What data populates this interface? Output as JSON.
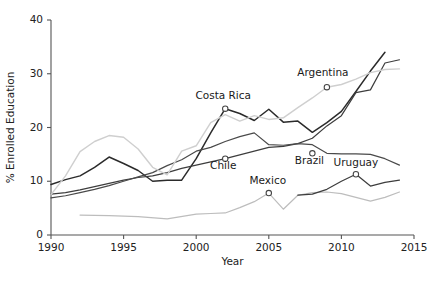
{
  "chart_data": {
    "type": "line",
    "title": "",
    "xlabel": "Year",
    "ylabel": "% Enrolled Education",
    "xlim": [
      1990,
      2015
    ],
    "ylim": [
      0,
      40
    ],
    "xticks": [
      1990,
      1995,
      2000,
      2005,
      2010,
      2015
    ],
    "yticks": [
      0,
      10,
      20,
      30,
      40
    ],
    "grid": false,
    "legend": "inline-annotations",
    "series": [
      {
        "name": "Costa Rica",
        "color": "#2b2b2b",
        "width": 1.5,
        "x": [
          1990,
          1991,
          1992,
          1993,
          1994,
          1995,
          1996,
          1997,
          1998,
          1999,
          2000,
          2001,
          2002,
          2003,
          2004,
          2005,
          2006,
          2007,
          2008,
          2009,
          2010,
          2011,
          2012,
          2013
        ],
        "y": [
          9.4,
          10.3,
          11.0,
          12.6,
          14.5,
          13.3,
          12.0,
          10.0,
          10.2,
          10.2,
          14.2,
          19.0,
          23.5,
          22.6,
          21.3,
          23.4,
          21.0,
          21.2,
          19.1,
          20.9,
          23.0,
          26.7,
          30.5,
          34.0
        ]
      },
      {
        "name": "Chile",
        "color": "#3d3d3d",
        "width": 1.2,
        "x": [
          1990,
          1991,
          1992,
          1993,
          1994,
          1995,
          1996,
          1997,
          1998,
          1999,
          2000,
          2001,
          2002,
          2003,
          2004,
          2005,
          2006,
          2007,
          2008,
          2009,
          2010,
          2011,
          2012,
          2013,
          2014
        ],
        "y": [
          7.6,
          7.9,
          8.4,
          9.0,
          9.6,
          10.2,
          10.7,
          11.0,
          11.6,
          12.4,
          13.0,
          13.6,
          14.2,
          14.9,
          15.6,
          16.3,
          16.5,
          17.0,
          18.0,
          20.3,
          22.2,
          26.5,
          27.0,
          32.0,
          32.6
        ]
      },
      {
        "name": "Brazil",
        "color": "#4a4a4a",
        "width": 1.2,
        "x": [
          1990,
          1991,
          1992,
          1993,
          1994,
          1995,
          1996,
          1997,
          1998,
          1999,
          2000,
          2001,
          2002,
          2003,
          2004,
          2005,
          2006,
          2007,
          2008,
          2009,
          2010,
          2011,
          2012,
          2013,
          2014
        ],
        "y": [
          6.9,
          7.3,
          7.9,
          8.5,
          9.2,
          10.0,
          10.8,
          11.6,
          12.9,
          14.0,
          15.6,
          16.3,
          17.4,
          18.3,
          19.0,
          16.8,
          16.7,
          17.0,
          16.8,
          15.2,
          15.1,
          15.1,
          15.0,
          14.2,
          13.0
        ]
      },
      {
        "name": "Argentina",
        "color": "#cfcfcf",
        "width": 1.4,
        "x": [
          1990,
          1991,
          1992,
          1993,
          1994,
          1995,
          1996,
          1997,
          1998,
          1999,
          2000,
          2001,
          2002,
          2003,
          2004,
          2005,
          2006,
          2007,
          2008,
          2009,
          2010,
          2011,
          2012,
          2013,
          2014
        ],
        "y": [
          7.5,
          11.0,
          15.5,
          17.4,
          18.5,
          18.2,
          16.0,
          12.6,
          11.2,
          15.6,
          16.6,
          20.9,
          22.4,
          21.2,
          22.2,
          21.5,
          21.8,
          23.7,
          25.5,
          27.5,
          28.0,
          29.0,
          30.2,
          30.8,
          30.9
        ]
      },
      {
        "name": "Mexico",
        "color": "#bdbdbd",
        "width": 1.2,
        "x": [
          1992,
          1994,
          1996,
          1998,
          2000,
          2001,
          2002,
          2003,
          2004,
          2005,
          2006,
          2007,
          2008,
          2009,
          2010,
          2011,
          2012,
          2013,
          2014
        ],
        "y": [
          3.7,
          3.6,
          3.4,
          3.0,
          3.9,
          4.0,
          4.1,
          5.1,
          6.2,
          7.8,
          4.8,
          7.4,
          7.9,
          8.0,
          7.7,
          7.0,
          6.3,
          7.0,
          8.0
        ]
      },
      {
        "name": "Uruguay",
        "color": "#3d3d3d",
        "width": 1.2,
        "x": [
          2007,
          2008,
          2009,
          2010,
          2011,
          2012,
          2013,
          2014
        ],
        "y": [
          7.4,
          7.6,
          8.5,
          10.0,
          11.3,
          9.1,
          9.8,
          10.2
        ]
      }
    ],
    "annotations": [
      {
        "label": "Argentina",
        "x": 2009,
        "y": 27.5,
        "label_dx": -4,
        "label_dy": -11,
        "series": "Argentina"
      },
      {
        "label": "Costa Rica",
        "x": 2002,
        "y": 23.5,
        "label_dx": -2,
        "label_dy": -10,
        "series": "Costa Rica"
      },
      {
        "label": "Chile",
        "x": 2002,
        "y": 14.2,
        "label_dx": -2,
        "label_dy": 10,
        "series": "Chile"
      },
      {
        "label": "Brazil",
        "x": 2008,
        "y": 15.2,
        "label_dx": -3,
        "label_dy": 11,
        "series": "Brazil"
      },
      {
        "label": "Uruguay",
        "x": 2011,
        "y": 11.3,
        "label_dx": 0,
        "label_dy": -8,
        "series": "Uruguay"
      },
      {
        "label": "Mexico",
        "x": 2005,
        "y": 7.8,
        "label_dx": -1,
        "label_dy": -9,
        "series": "Mexico"
      }
    ]
  },
  "axes": {
    "x_title": "Year",
    "y_title": "% Enrolled Education",
    "x_tick_labels": [
      "1990",
      "1995",
      "2000",
      "2005",
      "2010",
      "2015"
    ],
    "y_tick_labels": [
      "0",
      "10",
      "20",
      "30",
      "40"
    ]
  },
  "colors": {
    "axis": "#555555",
    "text": "#222222",
    "background": "#ffffff"
  }
}
